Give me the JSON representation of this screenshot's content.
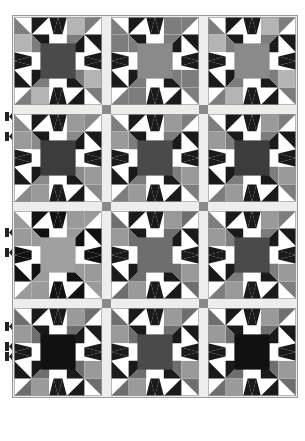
{
  "document": {
    "title": "Quilt Block Layout Diagram",
    "type": "quilt-pattern-diagram"
  },
  "palette": {
    "background": "#ffffff",
    "white": "#ffffff",
    "off_white": "#f2f2f0",
    "black": "#111111",
    "dark": "#1a1a1a",
    "dark_gray": "#4a4a4a",
    "medium_gray": "#7d7d7d",
    "light_gray": "#b4b4b4",
    "pale_gray": "#d8d8d6",
    "sashing": "#ececeа",
    "sashing_fill": "#ededeb",
    "cornerstone": "#8a8a8a",
    "outline": "#9a9a9a",
    "tick": "#222222"
  },
  "layout": {
    "canvas_width": 305,
    "canvas_height": 441,
    "quilt_left": 14,
    "quilt_top": 17,
    "columns": 3,
    "rows": 4,
    "block_size": 88,
    "sashing_width": 9,
    "block_grid_units": 5,
    "outer_border": 1
  },
  "sashing": {
    "label": "sashing-strip",
    "fill": "#ededeb",
    "cornerstone_fill": "#8a8a8a",
    "cornerstone_label": "cornerstone-square"
  },
  "edge_markers": {
    "label": "alignment-tick",
    "color": "#222222",
    "positions_y": [
      112,
      132,
      228,
      248,
      322,
      342,
      352
    ],
    "x": 5,
    "width": 4,
    "height": 9
  },
  "chart_data": {
    "type": "table",
    "blocks": [
      {
        "row": 0,
        "col": 0,
        "name": "block-r1c1",
        "center": "#4a4a4a",
        "star_point": "#1a1a1a",
        "corner_square": "#b4b4b4",
        "corner_tri_a": "#7d7d7d",
        "corner_tri_b": "#1a1a1a",
        "side_tri": "#1a1a1a",
        "ground": "#ffffff"
      },
      {
        "row": 0,
        "col": 1,
        "name": "block-r1c2",
        "center": "#8a8a8a",
        "star_point": "#1a1a1a",
        "corner_square": "#7d7d7d",
        "corner_tri_a": "#7d7d7d",
        "corner_tri_b": "#1a1a1a",
        "side_tri": "#1a1a1a",
        "ground": "#ffffff"
      },
      {
        "row": 0,
        "col": 2,
        "name": "block-r1c3",
        "center": "#8a8a8a",
        "star_point": "#1a1a1a",
        "corner_square": "#b4b4b4",
        "corner_tri_a": "#7d7d7d",
        "corner_tri_b": "#1a1a1a",
        "side_tri": "#1a1a1a",
        "ground": "#ffffff"
      },
      {
        "row": 1,
        "col": 0,
        "name": "block-r2c1",
        "center": "#3c3c3c",
        "star_point": "#1a1a1a",
        "corner_square": "#9a9a9a",
        "corner_tri_a": "#8a8a8a",
        "corner_tri_b": "#1a1a1a",
        "side_tri": "#1a1a1a",
        "ground": "#ffffff"
      },
      {
        "row": 1,
        "col": 1,
        "name": "block-r2c2",
        "center": "#4a4a4a",
        "star_point": "#1a1a1a",
        "corner_square": "#9a9a9a",
        "corner_tri_a": "#7d7d7d",
        "corner_tri_b": "#1a1a1a",
        "side_tri": "#1a1a1a",
        "ground": "#ffffff"
      },
      {
        "row": 1,
        "col": 2,
        "name": "block-r2c3",
        "center": "#3c3c3c",
        "star_point": "#1a1a1a",
        "corner_square": "#9a9a9a",
        "corner_tri_a": "#7d7d7d",
        "corner_tri_b": "#1a1a1a",
        "side_tri": "#1a1a1a",
        "ground": "#ffffff"
      },
      {
        "row": 2,
        "col": 0,
        "name": "block-r3c1",
        "center": "#a0a0a0",
        "star_point": "#111111",
        "corner_square": "#9a9a9a",
        "corner_tri_a": "#9a9a9a",
        "corner_tri_b": "#111111",
        "side_tri": "#111111",
        "ground": "#ffffff"
      },
      {
        "row": 2,
        "col": 1,
        "name": "block-r3c2",
        "center": "#6e6e6e",
        "star_point": "#1a1a1a",
        "corner_square": "#9a9a9a",
        "corner_tri_a": "#6e6e6e",
        "corner_tri_b": "#1a1a1a",
        "side_tri": "#1a1a1a",
        "ground": "#ffffff"
      },
      {
        "row": 2,
        "col": 2,
        "name": "block-r3c3",
        "center": "#4a4a4a",
        "star_point": "#1a1a1a",
        "corner_square": "#9a9a9a",
        "corner_tri_a": "#7d7d7d",
        "corner_tri_b": "#1a1a1a",
        "side_tri": "#1a1a1a",
        "ground": "#ffffff"
      },
      {
        "row": 3,
        "col": 0,
        "name": "block-r4c1",
        "center": "#111111",
        "star_point": "#1a1a1a",
        "corner_square": "#9a9a9a",
        "corner_tri_a": "#6e6e6e",
        "corner_tri_b": "#1a1a1a",
        "side_tri": "#6e6e6e",
        "ground": "#ffffff"
      },
      {
        "row": 3,
        "col": 1,
        "name": "block-r4c2",
        "center": "#4a4a4a",
        "star_point": "#1a1a1a",
        "corner_square": "#9a9a9a",
        "corner_tri_a": "#6e6e6e",
        "corner_tri_b": "#1a1a1a",
        "side_tri": "#1a1a1a",
        "ground": "#ffffff"
      },
      {
        "row": 3,
        "col": 2,
        "name": "block-r4c3",
        "center": "#111111",
        "star_point": "#1a1a1a",
        "corner_square": "#9a9a9a",
        "corner_tri_a": "#6e6e6e",
        "corner_tri_b": "#1a1a1a",
        "side_tri": "#1a1a1a",
        "ground": "#ffffff"
      }
    ]
  }
}
